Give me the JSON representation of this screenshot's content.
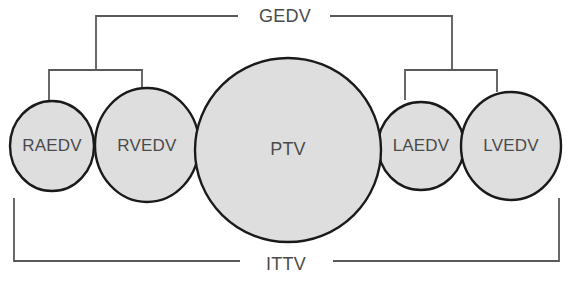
{
  "diagram": {
    "colors": {
      "shape_fill": "#dedede",
      "shape_stroke": "#1a1a1a",
      "bracket_stroke": "#595959",
      "label_text": "#4a4a4a",
      "background": "#ffffff"
    },
    "compartments": [
      {
        "id": "raedv",
        "label": "RAEDV",
        "cx": 52,
        "cy": 146,
        "rx": 42,
        "ry": 45
      },
      {
        "id": "rvedv",
        "label": "RVEDV",
        "cx": 147,
        "cy": 145,
        "rx": 52,
        "ry": 57
      },
      {
        "id": "ptv",
        "label": "PTV",
        "cx": 288,
        "cy": 150,
        "rx": 93,
        "ry": 92
      },
      {
        "id": "laedv",
        "label": "LAEDV",
        "cx": 421,
        "cy": 146,
        "rx": 43,
        "ry": 44
      },
      {
        "id": "lvedv",
        "label": "LVEDV",
        "cx": 511,
        "cy": 146,
        "rx": 50,
        "ry": 54
      }
    ],
    "brackets": [
      {
        "id": "right-heart-bracket",
        "label": "",
        "path": "M 49 100 L 49 70 L 142 70 L 142 92"
      },
      {
        "id": "left-heart-bracket",
        "label": "",
        "path": "M 405 100 L 405 70 L 497 70 L 497 92"
      },
      {
        "id": "gedv-bracket-left",
        "label": "",
        "path": "M 96 70 L 96 16 L 238 16"
      },
      {
        "id": "gedv-bracket-right",
        "label": "",
        "path": "M 452 70 L 452 16 L 330 16"
      },
      {
        "id": "ittv-bracket-left",
        "label": "",
        "path": "M 14 198 L 14 261 L 240 261"
      },
      {
        "id": "ittv-bracket-right",
        "label": "",
        "path": "M 559 198 L 559 261 L 333 261"
      }
    ],
    "bracket_labels": [
      {
        "id": "gedv",
        "label": "GEDV",
        "x": 285,
        "y": 16
      },
      {
        "id": "ittv",
        "label": "ITTV",
        "x": 286,
        "y": 264
      }
    ]
  }
}
